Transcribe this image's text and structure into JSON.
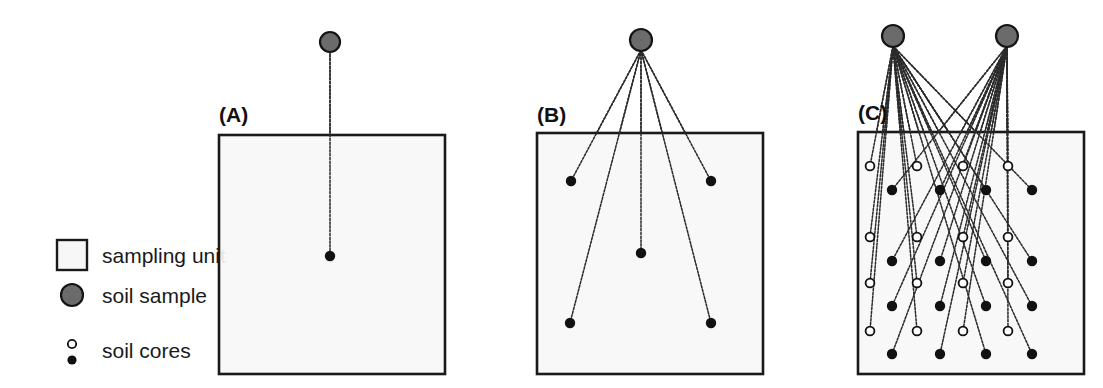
{
  "figure": {
    "background_color": "#ffffff",
    "unit_fill": "#f7f7f7",
    "unit_stroke": "#1a1a1a",
    "sample_fill": "#6b6b6b",
    "sample_stroke": "#141414",
    "core_filled_color": "#111111",
    "core_open_fill": "#ffffff",
    "core_open_stroke": "#111111",
    "link_color": "#2b2b2b"
  },
  "legend": {
    "items": [
      {
        "id": "sampling-unit",
        "label": "sampling unit",
        "marker": "square-outline"
      },
      {
        "id": "soil-sample",
        "label": "soil sample",
        "marker": "filled-gray-circle"
      },
      {
        "id": "soil-cores",
        "label": "soil cores",
        "marker": "small-open-and-filled-circles"
      }
    ]
  },
  "panels": [
    {
      "id": "A",
      "label": "(A)",
      "label_x": 219,
      "label_y": 122,
      "unit": {
        "x": 219,
        "y": 135,
        "w": 226,
        "h": 239
      },
      "samples": [
        {
          "x": 330,
          "y": 42,
          "r": 10
        }
      ],
      "cores": [
        {
          "x": 330,
          "y": 256,
          "type": "filled",
          "sample": 0
        }
      ],
      "core_count": 1,
      "sample_count": 1
    },
    {
      "id": "B",
      "label": "(B)",
      "label_x": 537,
      "label_y": 122,
      "unit": {
        "x": 537,
        "y": 133,
        "w": 226,
        "h": 241
      },
      "samples": [
        {
          "x": 641,
          "y": 40,
          "r": 11
        }
      ],
      "cores": [
        {
          "x": 571,
          "y": 181,
          "type": "filled",
          "sample": 0
        },
        {
          "x": 711,
          "y": 181,
          "type": "filled",
          "sample": 0
        },
        {
          "x": 641,
          "y": 253,
          "type": "filled",
          "sample": 0
        },
        {
          "x": 570,
          "y": 323,
          "type": "filled",
          "sample": 0
        },
        {
          "x": 711,
          "y": 323,
          "type": "filled",
          "sample": 0
        }
      ],
      "core_count": 5,
      "sample_count": 1
    },
    {
      "id": "C",
      "label": "(C)",
      "label_x": 858,
      "label_y": 120,
      "unit": {
        "x": 858,
        "y": 132,
        "w": 226,
        "h": 242
      },
      "samples": [
        {
          "x": 893,
          "y": 36,
          "r": 11
        },
        {
          "x": 1007,
          "y": 36,
          "r": 11
        }
      ],
      "cores": [
        {
          "x": 870,
          "y": 166,
          "type": "open",
          "sample": 0
        },
        {
          "x": 917,
          "y": 166,
          "type": "open",
          "sample": 0
        },
        {
          "x": 963,
          "y": 166,
          "type": "open",
          "sample": 1
        },
        {
          "x": 1008,
          "y": 166,
          "type": "open",
          "sample": 1
        },
        {
          "x": 892,
          "y": 190,
          "type": "filled",
          "sample": 1
        },
        {
          "x": 940,
          "y": 190,
          "type": "filled",
          "sample": 1
        },
        {
          "x": 986,
          "y": 190,
          "type": "filled",
          "sample": 0
        },
        {
          "x": 1032,
          "y": 190,
          "type": "filled",
          "sample": 0
        },
        {
          "x": 870,
          "y": 237,
          "type": "open",
          "sample": 0
        },
        {
          "x": 917,
          "y": 237,
          "type": "open",
          "sample": 0
        },
        {
          "x": 963,
          "y": 237,
          "type": "open",
          "sample": 1
        },
        {
          "x": 1008,
          "y": 237,
          "type": "open",
          "sample": 1
        },
        {
          "x": 892,
          "y": 261,
          "type": "filled",
          "sample": 1
        },
        {
          "x": 940,
          "y": 261,
          "type": "filled",
          "sample": 1
        },
        {
          "x": 986,
          "y": 261,
          "type": "filled",
          "sample": 0
        },
        {
          "x": 1032,
          "y": 261,
          "type": "filled",
          "sample": 0
        },
        {
          "x": 870,
          "y": 283,
          "type": "open",
          "sample": 0
        },
        {
          "x": 917,
          "y": 283,
          "type": "open",
          "sample": 0
        },
        {
          "x": 963,
          "y": 283,
          "type": "open",
          "sample": 1
        },
        {
          "x": 1008,
          "y": 283,
          "type": "open",
          "sample": 1
        },
        {
          "x": 892,
          "y": 306,
          "type": "filled",
          "sample": 1
        },
        {
          "x": 940,
          "y": 306,
          "type": "filled",
          "sample": 1
        },
        {
          "x": 986,
          "y": 306,
          "type": "filled",
          "sample": 0
        },
        {
          "x": 1032,
          "y": 306,
          "type": "filled",
          "sample": 0
        },
        {
          "x": 870,
          "y": 331,
          "type": "open",
          "sample": 0
        },
        {
          "x": 917,
          "y": 331,
          "type": "open",
          "sample": 0
        },
        {
          "x": 963,
          "y": 331,
          "type": "open",
          "sample": 1
        },
        {
          "x": 1008,
          "y": 331,
          "type": "open",
          "sample": 1
        },
        {
          "x": 892,
          "y": 354,
          "type": "filled",
          "sample": 1
        },
        {
          "x": 940,
          "y": 354,
          "type": "filled",
          "sample": 1
        },
        {
          "x": 986,
          "y": 354,
          "type": "filled",
          "sample": 0
        },
        {
          "x": 1032,
          "y": 354,
          "type": "filled",
          "sample": 0
        }
      ],
      "core_count": 32,
      "sample_count": 2
    }
  ]
}
